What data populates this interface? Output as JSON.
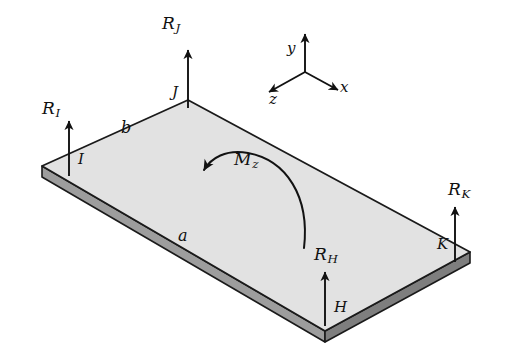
{
  "figure": {
    "type": "engineering-free-body-diagram",
    "background_color": "#ffffff",
    "plate": {
      "top_face_color": "#e2e2e2",
      "side_face_color": "#9d9d9d",
      "outline_color": "#1a1a1a",
      "thickness_px": 11
    },
    "ink_color": "#121212"
  },
  "reactions": [
    {
      "id": "R_I",
      "force_label": "R",
      "force_subscript": "I",
      "point_label": "I",
      "direction": "up",
      "point_name": "reaction-I"
    },
    {
      "id": "R_J",
      "force_label": "R",
      "force_subscript": "J",
      "point_label": "J",
      "direction": "up",
      "point_name": "reaction-J"
    },
    {
      "id": "R_K",
      "force_label": "R",
      "force_subscript": "K",
      "point_label": "K",
      "direction": "up",
      "point_name": "reaction-K"
    },
    {
      "id": "R_H",
      "force_label": "R",
      "force_subscript": "H",
      "point_label": "H",
      "direction": "up",
      "point_name": "reaction-H"
    }
  ],
  "moment": {
    "label": "M",
    "subscript": "z",
    "sense": "curved-arrow-pointing-left",
    "about_axis": "z"
  },
  "dimensions": [
    {
      "label": "a",
      "edge": "front-left-edge"
    },
    {
      "label": "b",
      "edge": "back-left-edge"
    }
  ],
  "axes": {
    "origin_label": "",
    "items": [
      {
        "label": "y",
        "direction": "up"
      },
      {
        "label": "x",
        "direction": "right-down"
      },
      {
        "label": "z",
        "direction": "left-down"
      }
    ]
  }
}
